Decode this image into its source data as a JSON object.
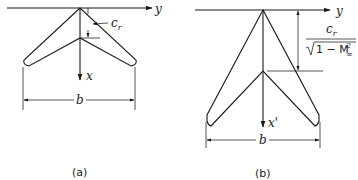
{
  "panels": [
    {
      "id": "a",
      "caption": "(a)",
      "axis_y_label": "y",
      "axis_x_label": "x",
      "chord_label_main": "c",
      "chord_label_sub": "r",
      "span_label": "b"
    },
    {
      "id": "b",
      "caption": "(b)",
      "axis_y_label": "y",
      "axis_x_label": "x'",
      "chord_fraction_num_main": "c",
      "chord_fraction_num_sub": "r",
      "chord_fraction_den_prefix": "1 − M",
      "chord_fraction_den_sup": "2",
      "chord_fraction_den_sub": "∞",
      "span_label": "b"
    }
  ],
  "colors": {
    "line": "#1a1a1a",
    "background": "#ffffff"
  }
}
